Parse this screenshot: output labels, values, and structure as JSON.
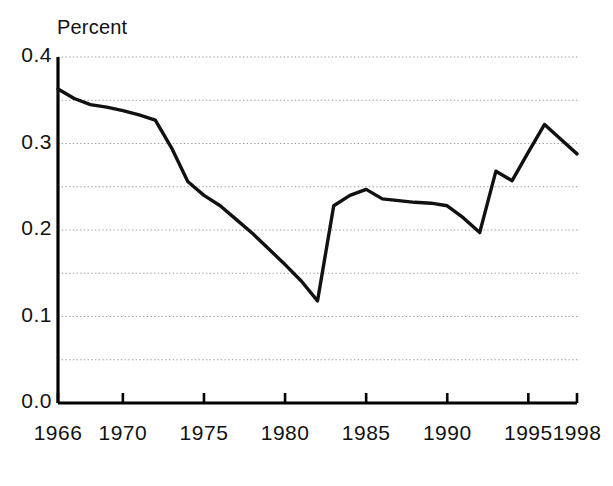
{
  "chart_data": {
    "type": "line",
    "title": "",
    "subtitle": "",
    "ylabel": "Percent",
    "xlabel": "",
    "ylim": [
      0.0,
      0.4
    ],
    "xlim": [
      1966,
      1998
    ],
    "grid": true,
    "grid_orientation": "horizontal",
    "grid_style": "dotted",
    "legend": "none",
    "y_ticks_major": [
      "0.0",
      "0.1",
      "0.2",
      "0.3",
      "0.4"
    ],
    "y_ticks_major_values": [
      0.0,
      0.1,
      0.2,
      0.3,
      0.4
    ],
    "y_gridline_values": [
      0.05,
      0.1,
      0.15,
      0.2,
      0.25,
      0.3,
      0.35,
      0.4
    ],
    "x_ticks": [
      "1966",
      "1970",
      "1975",
      "1980",
      "1985",
      "1990",
      "1995",
      "1998"
    ],
    "x_tick_values": [
      1966,
      1970,
      1975,
      1980,
      1985,
      1990,
      1995,
      1998
    ],
    "line_color": "#111111",
    "grid_color": "#999999",
    "axis_color": "#000000",
    "x": [
      1966,
      1967,
      1968,
      1969,
      1970,
      1971,
      1972,
      1973,
      1974,
      1975,
      1976,
      1977,
      1978,
      1979,
      1980,
      1981,
      1982,
      1983,
      1984,
      1985,
      1986,
      1987,
      1988,
      1989,
      1990,
      1991,
      1992,
      1993,
      1994,
      1995,
      1996,
      1997,
      1998
    ],
    "values": [
      0.363,
      0.352,
      0.345,
      0.342,
      0.338,
      0.333,
      0.327,
      0.295,
      0.256,
      0.24,
      0.228,
      0.212,
      0.196,
      0.178,
      0.16,
      0.141,
      0.118,
      0.228,
      0.24,
      0.247,
      0.236,
      0.234,
      0.232,
      0.231,
      0.228,
      0.214,
      0.197,
      0.268,
      0.257,
      0.29,
      0.322,
      0.305,
      0.288
    ],
    "series": [
      {
        "name": "Percent",
        "values": [
          0.363,
          0.352,
          0.345,
          0.342,
          0.338,
          0.333,
          0.327,
          0.295,
          0.256,
          0.24,
          0.228,
          0.212,
          0.196,
          0.178,
          0.16,
          0.141,
          0.118,
          0.228,
          0.24,
          0.247,
          0.236,
          0.234,
          0.232,
          0.231,
          0.228,
          0.214,
          0.197,
          0.268,
          0.257,
          0.29,
          0.322,
          0.305,
          0.288
        ]
      }
    ]
  }
}
